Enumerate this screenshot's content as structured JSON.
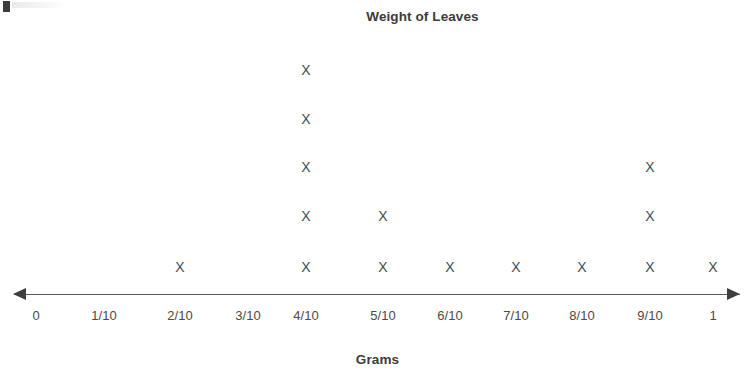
{
  "chart_data": {
    "type": "bar",
    "plot_style": "dot-plot-line-plot-with-x-marks",
    "title": "Weight of Leaves",
    "xlabel": "Grams",
    "ylabel": "",
    "grid": false,
    "legend": null,
    "mark_glyph": "X",
    "axis_style": "number-line-with-double-arrowheads",
    "categories": [
      "0",
      "1/10",
      "2/10",
      "3/10",
      "4/10",
      "5/10",
      "6/10",
      "7/10",
      "8/10",
      "9/10",
      "1"
    ],
    "category_numeric_values": [
      0,
      0.1,
      0.2,
      0.3,
      0.4,
      0.5,
      0.6,
      0.7,
      0.8,
      0.9,
      1
    ],
    "values": [
      0,
      0,
      1,
      0,
      5,
      2,
      1,
      1,
      1,
      3,
      1
    ],
    "total_count": 15,
    "max_count": 5,
    "xlim": [
      0,
      1
    ],
    "ylim": [
      0,
      5
    ],
    "tick_labels": [
      "0",
      "1/10",
      "2/10",
      "3/10",
      "4/10",
      "5/10",
      "6/10",
      "7/10",
      "8/10",
      "9/10",
      "1"
    ],
    "colors": {
      "mark": "#4c4c4c",
      "axis": "#5a5a5a",
      "arrowhead": "#3f3f3f",
      "title_text": "#3c3c3c",
      "tick_text": "#4a4a4a",
      "background": "#ffffff"
    }
  },
  "chart": {
    "title": "Weight of Leaves",
    "axis_title": "Grams"
  },
  "axis": {
    "ticks": [
      {
        "label": "0",
        "x": 36,
        "count": 0
      },
      {
        "label": "1/10",
        "x": 104,
        "count": 0
      },
      {
        "label": "2/10",
        "x": 180,
        "count": 1
      },
      {
        "label": "3/10",
        "x": 248,
        "count": 0
      },
      {
        "label": "4/10",
        "x": 306,
        "count": 5
      },
      {
        "label": "5/10",
        "x": 383,
        "count": 2
      },
      {
        "label": "6/10",
        "x": 450,
        "count": 1
      },
      {
        "label": "7/10",
        "x": 516,
        "count": 1
      },
      {
        "label": "8/10",
        "x": 582,
        "count": 1
      },
      {
        "label": "9/10",
        "x": 650,
        "count": 3
      },
      {
        "label": "1",
        "x": 713,
        "count": 1
      }
    ],
    "row_y": [
      267,
      216,
      167,
      119,
      70
    ]
  }
}
